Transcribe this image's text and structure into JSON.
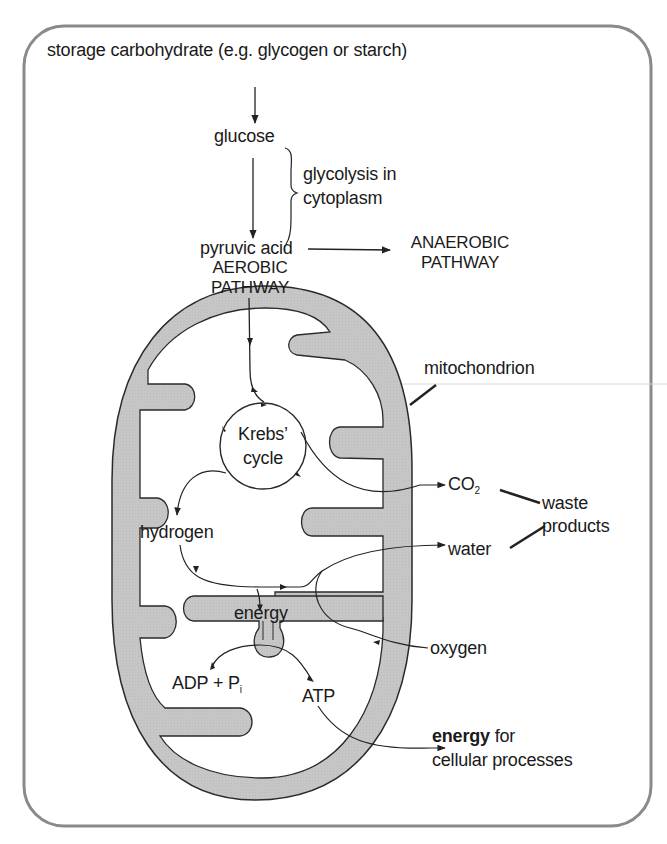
{
  "diagram": {
    "labels": {
      "storage": "storage carbohydrate (e.g. glycogen or starch)",
      "glucose": "glucose",
      "glycolysis_line1": "glycolysis in",
      "glycolysis_line2": "cytoplasm",
      "pyruvic": "pyruvic acid",
      "aerobic_line1": "AEROBIC",
      "aerobic_line2": "PATHWAY",
      "anaerobic_line1": "ANAEROBIC",
      "anaerobic_line2": "PATHWAY",
      "mitochondrion": "mitochondrion",
      "krebs_line1": "Krebs’",
      "krebs_line2": "cycle",
      "co2_main": "CO",
      "co2_sub": "2",
      "waste_line1": "waste",
      "waste_line2": "products",
      "hydrogen": "hydrogen",
      "water": "water",
      "energy_inner": "energy",
      "oxygen": "oxygen",
      "adp_main": "ADP + P",
      "adp_sub": "i",
      "atp": "ATP",
      "energy_bold": "energy",
      "energy_for": " for",
      "cellular": "cellular processes"
    },
    "colors": {
      "membrane_fill": "#c8c8c8",
      "stroke": "#2a2a2a",
      "frame": "#8a8a8a"
    }
  }
}
